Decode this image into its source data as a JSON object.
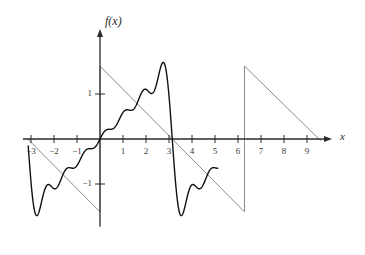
{
  "chart_data": {
    "type": "line",
    "title": "",
    "subtitle": "",
    "xlabel": "x",
    "ylabel": "f(x)",
    "xlim": [
      -3.35,
      10.1
    ],
    "ylim": [
      -1.95,
      2.2
    ],
    "grid": false,
    "legend_position": "none",
    "annotations": [
      "Fourier partial sum approximation of a sawtooth wave",
      "Gibbs oscillations visible near the jump discontinuities"
    ],
    "x_ticks": [
      -3,
      -2,
      -1,
      1,
      2,
      3,
      4,
      5,
      6,
      7,
      8,
      9
    ],
    "x_tick_labels": [
      "−3",
      "−2",
      "−1",
      "1",
      "2",
      "3",
      "4",
      "5",
      "6",
      "7",
      "8",
      "9"
    ],
    "y_ticks": [
      1,
      -1
    ],
    "y_tick_labels": [
      "1",
      "−1"
    ],
    "period": 6.283185,
    "jump_locations": [
      -3.14159,
      0,
      6.28318
    ],
    "zero_crossings": [
      -3.14159,
      0,
      3.14159,
      9.42477
    ],
    "series": [
      {
        "name": "sawtooth target",
        "color": "#8c8c8c",
        "width": 1.0,
        "type": "piecewise-linear",
        "description": "ideal sawtooth, slope -1/2 per unit, amplitude about 1.6, period 2*pi",
        "nodes_x": [
          -3.14159,
          0,
          0,
          6.28318,
          6.28318,
          9.6
        ],
        "nodes_y": [
          0.0,
          -1.62,
          1.62,
          -1.62,
          1.62,
          -0.04
        ]
      },
      {
        "name": "partial sum N=7",
        "color": "#111111",
        "width": 1.4,
        "type": "fourier-partial-sum",
        "terms": 7,
        "amplitude": 1.62,
        "x_start": -3.12,
        "x_end": 5.12,
        "description": "sum 2A/pi * sum_{k=1..7} (-1)^(k+1) sin(k x)/k",
        "peak_overshoot_y": 1.82,
        "peak_overshoot_x": 0.42,
        "min_undershoot_y": -1.8,
        "min_undershoot_x": -0.42
      }
    ]
  },
  "axes": {
    "x_axis_label": "x",
    "y_axis_label": "f(x)",
    "x_axis_arrow": true,
    "y_axis_arrow": true,
    "axis_color": "#2b2b2b"
  },
  "colors": {
    "background": "#ffffff",
    "curve": "#111111",
    "target": "#8c8c8c",
    "axis": "#2b2b2b",
    "tick_text": "#3a3a3a"
  }
}
